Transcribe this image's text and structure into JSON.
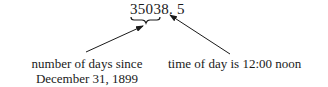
{
  "diagram": {
    "value": {
      "integer_part": "35038",
      "separator": ".",
      "fraction_part": " 5"
    },
    "annotations": [
      {
        "id": "integer",
        "label_line1": "number of days since",
        "label_line2": "December 31, 1899"
      },
      {
        "id": "fraction",
        "label": "time of day is 12:00 noon"
      }
    ],
    "colors": {
      "ink": "#1a1a1a",
      "background": "#ffffff"
    }
  }
}
